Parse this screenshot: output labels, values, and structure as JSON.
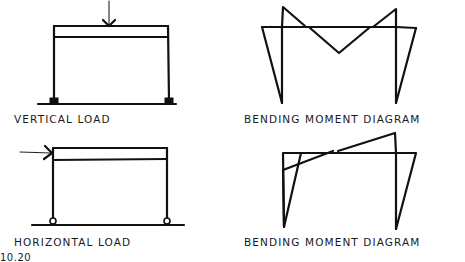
{
  "figure": {
    "number": "10.20",
    "panels": [
      {
        "id": "vertical-load",
        "caption": "VERTICAL LOAD",
        "supports": "fixed",
        "load": "vertical point load at midspan of beam"
      },
      {
        "id": "vertical-load-bmd",
        "caption": "BENDING MOMENT DIAGRAM",
        "description": "Hogging moments at beam-column joints, sagging triangle at midspan, column moments tapering to bases"
      },
      {
        "id": "horizontal-load",
        "caption": "HORIZONTAL LOAD",
        "supports": "pinned",
        "load": "horizontal point load at top-left corner"
      },
      {
        "id": "horizontal-load-bmd",
        "caption": "BENDING MOMENT DIAGRAM",
        "description": "Antisymmetric moment diagram, zero moment near beam midspan, column moments tapering to pinned bases"
      }
    ]
  }
}
